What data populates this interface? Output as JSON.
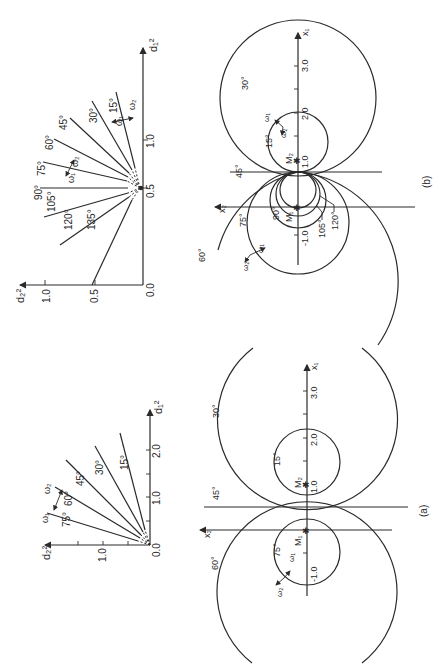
{
  "figure": {
    "panel_a_label": "(a)",
    "panel_b_label": "(b)"
  },
  "fan_b": {
    "x_axis_label": "d₁²",
    "y_axis_label": "d₂²",
    "x_ticks": [
      "0.5",
      "1.0"
    ],
    "y_ticks": [
      "0.5",
      "1.0"
    ],
    "origin_label": "0.0",
    "rays": [
      "15°",
      "30°",
      "45°",
      "60°",
      "75°",
      "90°",
      "105°",
      "120°",
      "135°"
    ],
    "omega1": "ω₁",
    "omega2": "ω₂"
  },
  "fan_a": {
    "x_axis_label": "d₁²",
    "y_axis_label": "d₂²",
    "x_ticks": [
      "1.0",
      "2.0"
    ],
    "y_ticks": [
      "1.0"
    ],
    "origin_label": "0.0",
    "rays": [
      "15°",
      "30°",
      "45°",
      "60°",
      "75°"
    ],
    "omega1": "ω₁",
    "omega2": "ω₂"
  },
  "circles_b": {
    "x1_label": "x₁",
    "x2_label": "x₂",
    "x1_ticks": [
      "1.0",
      "2.0",
      "3.0",
      "-1.0"
    ],
    "point_M1": "M₁",
    "point_M2": "M₂",
    "angle_labels": [
      "15°",
      "30°",
      "45°",
      "60°",
      "75°",
      "90°",
      "105°",
      "120°"
    ],
    "omega1": "ω₁",
    "omega2": "ω₂"
  },
  "circles_a": {
    "x1_label": "x₁",
    "x2_label": "x₂",
    "x1_ticks": [
      "1.0",
      "2.0",
      "3.0",
      "-1.0"
    ],
    "point_M1": "M₁",
    "point_M2": "M₂",
    "angle_labels": [
      "15°",
      "30°",
      "45°",
      "60°",
      "75°"
    ],
    "omega1": "ω₁",
    "omega2": "ω₂"
  }
}
